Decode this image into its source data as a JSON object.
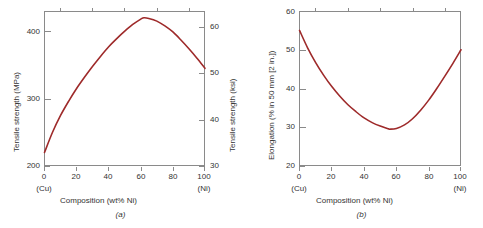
{
  "figure": {
    "panels": [
      {
        "caption": "(a)",
        "xlabel": "Composition (wt% Ni)",
        "x_ticks": [
          "0",
          "20",
          "40",
          "60",
          "80",
          "100"
        ],
        "x_end_labels": {
          "left": "(Cu)",
          "right": "(Ni)"
        },
        "ylabel_left": "Tensile strength (MPa)",
        "y_ticks_left": [
          "200",
          "300",
          "400"
        ],
        "ylabel_right": "Tensile strength (ksi)",
        "y_ticks_right": [
          "30",
          "40",
          "50",
          "60"
        ]
      },
      {
        "caption": "(b)",
        "xlabel": "Composition (wt% Ni)",
        "x_ticks": [
          "0",
          "20",
          "40",
          "60",
          "80",
          "100"
        ],
        "x_end_labels": {
          "left": "(Cu)",
          "right": "(Ni)"
        },
        "ylabel_left": "Elongation (% in 50 mm [2 in.])",
        "y_ticks_left": [
          "20",
          "30",
          "40",
          "50",
          "60"
        ]
      }
    ],
    "curve_color": "#9e2a2a",
    "axis_color": "#8a8a8a"
  },
  "chart_data": [
    {
      "type": "line",
      "title": "",
      "subtitle": "",
      "caption": "(a)",
      "xlabel": "Composition (wt% Ni)",
      "ylabel": "Tensile strength (MPa)",
      "ylabel_secondary": "Tensile strength (ksi)",
      "xlim": [
        0,
        100
      ],
      "ylim": [
        200,
        430
      ],
      "ylim_secondary": [
        30,
        62.3
      ],
      "xticks": [
        0,
        20,
        40,
        60,
        80,
        100
      ],
      "yticks": [
        200,
        300,
        400
      ],
      "yticks_secondary": [
        30,
        40,
        50,
        60
      ],
      "grid": false,
      "legend": "none",
      "annotations": [
        "(Cu) at 0 wt% Ni",
        "(Ni) at 100 wt% Ni"
      ],
      "x": [
        0,
        5,
        10,
        15,
        20,
        25,
        30,
        35,
        40,
        45,
        50,
        55,
        60,
        62,
        65,
        70,
        75,
        80,
        85,
        90,
        95,
        100
      ],
      "y": [
        220,
        250,
        275,
        296,
        315,
        332,
        348,
        363,
        377,
        389,
        400,
        410,
        418,
        420,
        419,
        415,
        408,
        399,
        387,
        374,
        360,
        345
      ],
      "series": [
        {
          "name": "Tensile strength",
          "values": [
            220,
            250,
            275,
            296,
            315,
            332,
            348,
            363,
            377,
            389,
            400,
            410,
            418,
            420,
            419,
            415,
            408,
            399,
            387,
            374,
            360,
            345
          ]
        }
      ]
    },
    {
      "type": "line",
      "title": "",
      "subtitle": "",
      "caption": "(b)",
      "xlabel": "Composition (wt% Ni)",
      "ylabel": "Elongation (% in 50 mm [2 in.])",
      "xlim": [
        0,
        100
      ],
      "ylim": [
        20,
        60
      ],
      "xticks": [
        0,
        20,
        40,
        60,
        80,
        100
      ],
      "yticks": [
        20,
        30,
        40,
        50,
        60
      ],
      "grid": false,
      "legend": "none",
      "annotations": [
        "(Cu) at 0 wt% Ni",
        "(Ni) at 100 wt% Ni"
      ],
      "x": [
        0,
        5,
        10,
        15,
        20,
        25,
        30,
        35,
        40,
        45,
        50,
        55,
        56,
        60,
        65,
        70,
        75,
        80,
        85,
        90,
        95,
        100
      ],
      "y": [
        55.0,
        50.5,
        46.7,
        43.4,
        40.5,
        38.0,
        35.8,
        34.0,
        32.4,
        31.2,
        30.3,
        29.6,
        29.5,
        29.7,
        30.6,
        32.2,
        34.4,
        37.0,
        40.0,
        43.2,
        46.5,
        50.0
      ],
      "series": [
        {
          "name": "Elongation",
          "values": [
            55.0,
            50.5,
            46.7,
            43.4,
            40.5,
            38.0,
            35.8,
            34.0,
            32.4,
            31.2,
            30.3,
            29.6,
            29.5,
            29.7,
            30.6,
            32.2,
            34.4,
            37.0,
            40.0,
            43.2,
            46.5,
            50.0
          ]
        }
      ]
    }
  ]
}
